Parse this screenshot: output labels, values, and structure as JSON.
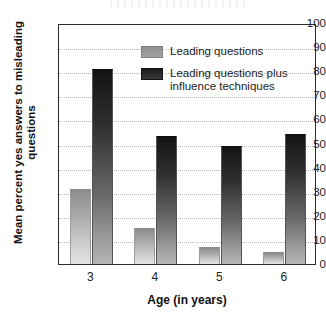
{
  "chart_data": {
    "type": "bar",
    "title": "",
    "xlabel": "Age (in years)",
    "ylabel": "Mean percent yes answers to misleading questions",
    "categories": [
      "3",
      "4",
      "5",
      "6"
    ],
    "series": [
      {
        "name": "Leading questions",
        "values": [
          31,
          15,
          7,
          5
        ],
        "color": "#a0a0a0"
      },
      {
        "name": "Leading questions plus influence techniques",
        "values": [
          81,
          53,
          49,
          54
        ],
        "color": "#1e1e1e"
      }
    ],
    "ylim": [
      0,
      100
    ],
    "ytick_labels": [
      "100",
      "90",
      "80",
      "70",
      "60",
      "50",
      "40",
      "30",
      "20",
      "10",
      "0"
    ],
    "ytick_values": [
      100,
      90,
      80,
      70,
      60,
      50,
      40,
      30,
      20,
      10,
      0
    ],
    "grid": true,
    "legend_position": "upper-right-inside"
  },
  "legend": {
    "entries": [
      {
        "label": "Leading questions",
        "swatch": "light-gray-swatch"
      },
      {
        "label": "Leading questions plus influence techniques",
        "swatch": "dark-gray-swatch"
      }
    ]
  },
  "axes": {
    "y_title": "Mean percent yes answers to misleading questions",
    "x_title": "Age (in years)"
  }
}
